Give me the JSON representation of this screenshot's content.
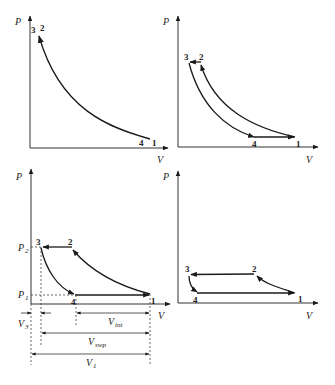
{
  "panels": [
    {
      "id": "top-left",
      "axis_labels": {
        "y": "P",
        "x": "V"
      },
      "points": {
        "1": "1",
        "2": "2",
        "3": "3",
        "4": "4"
      }
    },
    {
      "id": "top-right",
      "axis_labels": {
        "y": "P",
        "x": "V"
      },
      "points": {
        "1": "1",
        "2": "2",
        "3": "3",
        "4": "4"
      }
    },
    {
      "id": "bottom-left",
      "axis_labels": {
        "y": "P",
        "x": "V"
      },
      "points": {
        "1": "1",
        "2": "2",
        "3": "3",
        "4": "4"
      },
      "pressure_levels": {
        "p2": "P",
        "p2_sub": "2",
        "p1": "P",
        "p1_sub": "1"
      },
      "dimensions": {
        "v3": "V",
        "v3_sub": "3",
        "vint": "V",
        "vint_sub": "int",
        "vswp": "V",
        "vswp_sub": "swp",
        "v1": "V",
        "v1_sub": "1"
      }
    },
    {
      "id": "bottom-right",
      "axis_labels": {
        "y": "P",
        "x": "V"
      },
      "points": {
        "1": "1",
        "2": "2",
        "3": "3",
        "4": "4"
      }
    }
  ]
}
